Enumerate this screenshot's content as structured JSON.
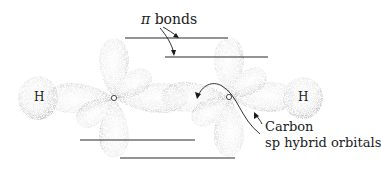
{
  "diagram": {
    "labels": {
      "pi_symbol": "π",
      "pi_bonds_text": " bonds",
      "hydrogen_left": "H",
      "hydrogen_right": "H",
      "carbon_line1": "Carbon",
      "carbon_line2": "sp hybrid orbitals",
      "carbon_atom_left": "C",
      "carbon_atom_right": "C"
    },
    "atoms": [
      {
        "id": "H1",
        "element": "H",
        "x": 38,
        "y": 98
      },
      {
        "id": "C1",
        "element": "C",
        "x": 114,
        "y": 98
      },
      {
        "id": "C2",
        "element": "C",
        "x": 229,
        "y": 97
      },
      {
        "id": "H2",
        "element": "H",
        "x": 303,
        "y": 98
      }
    ],
    "pi_bond_lines": [
      {
        "x1": 125,
        "y1": 38,
        "x2": 228,
        "y2": 38
      },
      {
        "x1": 165,
        "y1": 57,
        "x2": 268,
        "y2": 57
      },
      {
        "x1": 80,
        "y1": 140,
        "x2": 195,
        "y2": 140
      },
      {
        "x1": 120,
        "y1": 158,
        "x2": 235,
        "y2": 158
      }
    ],
    "colors": {
      "lobe_fill": "#e6e6e6",
      "lobe_edge": "#6a6a6a",
      "line": "#2a2a2a",
      "text": "#1a1a1a"
    }
  }
}
